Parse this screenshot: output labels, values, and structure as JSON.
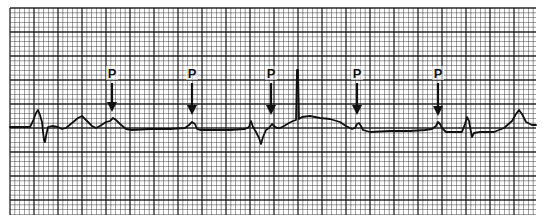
{
  "figure": {
    "type": "ecg-rhythm-strip",
    "background_color": "#ffffff",
    "grid_color": "#1a1a1a",
    "trace_color": "#111111",
    "grid": {
      "left": 10,
      "top": 8,
      "right": 536,
      "bottom": 215,
      "minor_step": 4.8,
      "major_every": 5
    },
    "baseline_y": 127
  },
  "annotations": {
    "p_markers": [
      {
        "label": "P",
        "x": 112,
        "label_y": 78,
        "arrow_top": 83,
        "arrow_tip": 112
      },
      {
        "label": "P",
        "x": 192,
        "label_y": 78,
        "arrow_top": 83,
        "arrow_tip": 115
      },
      {
        "label": "P",
        "x": 271,
        "label_y": 78,
        "arrow_top": 83,
        "arrow_tip": 115
      },
      {
        "label": "P",
        "x": 357,
        "label_y": 78,
        "arrow_top": 83,
        "arrow_tip": 115
      },
      {
        "label": "P",
        "x": 438,
        "label_y": 78,
        "arrow_top": 83,
        "arrow_tip": 116
      }
    ]
  },
  "trace": {
    "points": [
      [
        10,
        127
      ],
      [
        30,
        127
      ],
      [
        33,
        121
      ],
      [
        36,
        113
      ],
      [
        38,
        110
      ],
      [
        40,
        115
      ],
      [
        42,
        122
      ],
      [
        43,
        132
      ],
      [
        44,
        140
      ],
      [
        45,
        142
      ],
      [
        46,
        136
      ],
      [
        48,
        127
      ],
      [
        52,
        126
      ],
      [
        58,
        127
      ],
      [
        62,
        129
      ],
      [
        66,
        128
      ],
      [
        72,
        123
      ],
      [
        78,
        118
      ],
      [
        82,
        116
      ],
      [
        86,
        120
      ],
      [
        92,
        126
      ],
      [
        96,
        128
      ],
      [
        100,
        126
      ],
      [
        106,
        122
      ],
      [
        110,
        121
      ],
      [
        113,
        118
      ],
      [
        116,
        120
      ],
      [
        120,
        124
      ],
      [
        126,
        129
      ],
      [
        132,
        130
      ],
      [
        150,
        129
      ],
      [
        170,
        129
      ],
      [
        185,
        128
      ],
      [
        189,
        125
      ],
      [
        192,
        122
      ],
      [
        195,
        124
      ],
      [
        197,
        129
      ],
      [
        200,
        130
      ],
      [
        230,
        130
      ],
      [
        245,
        129
      ],
      [
        249,
        127
      ],
      [
        251,
        121
      ],
      [
        253,
        127
      ],
      [
        256,
        132
      ],
      [
        259,
        138
      ],
      [
        261,
        144
      ],
      [
        263,
        137
      ],
      [
        266,
        130
      ],
      [
        269,
        128
      ],
      [
        272,
        124
      ],
      [
        274,
        126
      ],
      [
        277,
        128
      ],
      [
        280,
        128
      ],
      [
        284,
        126
      ],
      [
        289,
        123
      ],
      [
        293,
        121
      ],
      [
        296,
        120
      ],
      [
        297,
        70
      ],
      [
        298,
        70
      ],
      [
        299,
        119
      ],
      [
        302,
        117
      ],
      [
        310,
        116
      ],
      [
        320,
        118
      ],
      [
        330,
        119
      ],
      [
        340,
        122
      ],
      [
        346,
        126
      ],
      [
        352,
        129
      ],
      [
        355,
        128
      ],
      [
        357,
        124
      ],
      [
        359,
        123
      ],
      [
        361,
        126
      ],
      [
        363,
        130
      ],
      [
        370,
        132
      ],
      [
        390,
        131
      ],
      [
        410,
        131
      ],
      [
        425,
        130
      ],
      [
        432,
        129
      ],
      [
        436,
        126
      ],
      [
        438,
        122
      ],
      [
        440,
        124
      ],
      [
        442,
        128
      ],
      [
        446,
        132
      ],
      [
        462,
        132
      ],
      [
        465,
        124
      ],
      [
        467,
        117
      ],
      [
        469,
        121
      ],
      [
        471,
        132
      ],
      [
        472,
        137
      ],
      [
        474,
        133
      ],
      [
        480,
        132
      ],
      [
        494,
        132
      ],
      [
        504,
        128
      ],
      [
        512,
        121
      ],
      [
        516,
        114
      ],
      [
        519,
        110
      ],
      [
        522,
        114
      ],
      [
        526,
        122
      ],
      [
        532,
        125
      ],
      [
        536,
        125
      ]
    ]
  }
}
